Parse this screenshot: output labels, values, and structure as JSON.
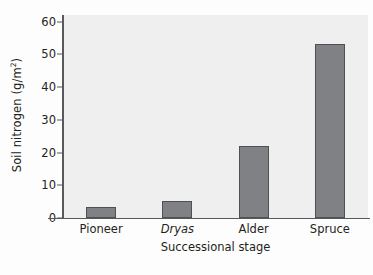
{
  "chart_data": {
    "type": "bar",
    "title": "",
    "xlabel": "Successional stage",
    "ylabel": "Soil nitrogen (g/m",
    "ylabel_sup": "2",
    "ylabel_tail": ")",
    "ylabel_full": "Soil nitrogen (g/m2)",
    "categories": [
      "Pioneer",
      "Dryas",
      "Alder",
      "Spruce"
    ],
    "category_styles": [
      "normal",
      "italic",
      "normal",
      "normal"
    ],
    "values": [
      3.5,
      5.3,
      22,
      53
    ],
    "ylim": [
      0,
      62
    ],
    "yticks": [
      0,
      10,
      20,
      30,
      40,
      50,
      60
    ],
    "ytick_labels": [
      "0",
      "10",
      "20",
      "30",
      "40",
      "50",
      "60"
    ],
    "grid": false,
    "legend": null,
    "bar_color": "#808184",
    "bar_edge_color": "#4f5052",
    "plot_background": "#efeff0",
    "axis_color": "#58595b",
    "text_color": "#231f20"
  }
}
